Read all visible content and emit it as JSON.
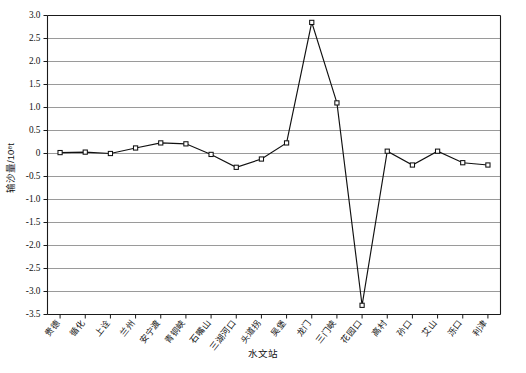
{
  "chart_data": {
    "type": "line",
    "title": "",
    "xlabel": "水文站",
    "ylabel": "输沙量/10⁸t",
    "ylim": [
      -3.5,
      3.0
    ],
    "ytick_step": 0.5,
    "grid": true,
    "legend": "none",
    "marker": "open-square",
    "categories": [
      "贵德",
      "循化",
      "上诠",
      "兰州",
      "安宁渡",
      "青铜峡",
      "石嘴山",
      "三湖河口",
      "头道拐",
      "吴堡",
      "龙门",
      "三门峡",
      "花园口",
      "高村",
      "孙口",
      "艾山",
      "泺口",
      "利津"
    ],
    "values": [
      0.02,
      0.03,
      0.0,
      0.12,
      0.23,
      0.21,
      -0.02,
      -0.3,
      -0.12,
      0.23,
      2.85,
      1.1,
      -3.3,
      0.05,
      -0.25,
      0.05,
      -0.2,
      -0.25
    ],
    "ytick_labels": [
      "3.0",
      "2.5",
      "2.0",
      "1.5",
      "1.0",
      "0.5",
      "0",
      "-0.5",
      "-1.0",
      "-1.5",
      "-2.0",
      "-2.5",
      "-3.0",
      "-3.5"
    ],
    "colors": {
      "line": "#111111",
      "marker_fill": "#ffffff",
      "grid": "#8e8e8e",
      "axis": "#1a1a1a",
      "background": "#ffffff"
    }
  }
}
